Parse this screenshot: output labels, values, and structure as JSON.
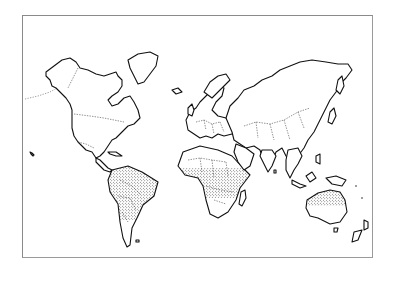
{
  "figure": {
    "type": "world-map",
    "style": "line-art outline map with dashed political borders",
    "shaded_pattern": "stipple (dotted)",
    "shaded_regions": [
      "Central America",
      "northern South America (Amazon basin)",
      "central Africa",
      "South Asia (India)",
      "Southeast Asia",
      "Indonesia / New Guinea",
      "northern Australia"
    ],
    "unshaded_regions": [
      "North America",
      "Europe",
      "North Africa",
      "Middle East",
      "Russia / North Asia",
      "southern South America",
      "southern Africa",
      "southern Australia",
      "New Zealand"
    ],
    "colors": {
      "outline": "#111111",
      "border_dashes": "#444444",
      "stipple": "#222222",
      "frame": "#8a8a8a",
      "background": "#ffffff"
    }
  }
}
